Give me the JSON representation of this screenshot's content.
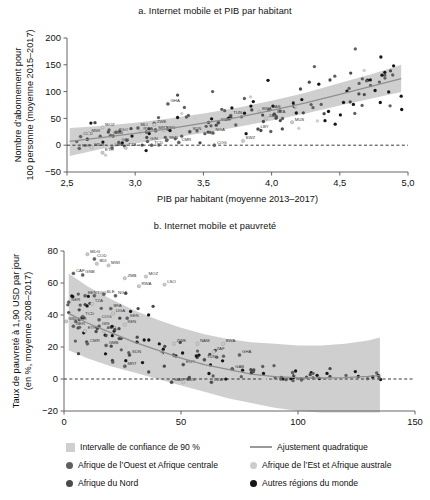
{
  "figure": {
    "panels": [
      {
        "id": "a",
        "title": "a. Internet mobile et PIB par habitant",
        "xlabel": "PIB par habitant (moyenne 2013–2017)",
        "ylabel_line1": "Nombre d’abonnement pour",
        "ylabel_line2": "100 personne (moyenne 2015–2017)"
      },
      {
        "id": "b",
        "title": "b. Internet mobile et pauvreté",
        "xlabel": "Nombre d’abonnement pour 100 personne (moyenne 2015–2017)",
        "ylabel_line1": "Taux de pauvreté à 1,90 USD par jour",
        "ylabel_line2": "(en %, moyenne 2008–2017)"
      }
    ]
  },
  "legend": {
    "items": [
      {
        "marker": "band-swatch",
        "label": "Intervalle de confiance de 90 %"
      },
      {
        "marker": "fit-line",
        "label": "Ajustement quadratique"
      },
      {
        "marker": "dot-ouest",
        "label": "Afrique de l’Ouest et Afrique centrale"
      },
      {
        "marker": "dot-est",
        "label": "Afrique de l’Est et Afrique australe"
      },
      {
        "marker": "dot-nord",
        "label": "Afrique du Nord"
      },
      {
        "marker": "dot-autres",
        "label": "Autres régions du monde"
      }
    ]
  },
  "colors": {
    "band": "#cfcfcf",
    "fit_line": "#8f8f8f",
    "zero_line": "#222222",
    "axis": "#555555",
    "dot_ouest": "#5f5f5f",
    "dot_est": "#cccccc",
    "dot_nord": "#4a4a4a",
    "dot_autres": "#161616"
  },
  "chart_data": [
    {
      "type": "scatter",
      "id": "a",
      "title": "a. Internet mobile et PIB par habitant",
      "xlabel": "PIB par habitant (moyenne 2013–2017)",
      "ylabel": "Nombre d’abonnement pour 100 personne (moyenne 2015–2017)",
      "xlim": [
        2.5,
        5.0
      ],
      "ylim": [
        -50,
        200
      ],
      "xticks": [
        "2,5",
        "3,0",
        "3,5",
        "4,0",
        "4,5",
        "5,0"
      ],
      "xtick_values": [
        2.5,
        3.0,
        3.5,
        4.0,
        4.5,
        5.0
      ],
      "yticks": [
        "200",
        "150",
        "100",
        "50",
        "0",
        "−50"
      ],
      "ytick_values": [
        200,
        150,
        100,
        50,
        0,
        -50
      ],
      "grid": false,
      "legend_position": "below-figure",
      "zero_line": 0,
      "fit_type": "linear/quadratic trend with 90% confidence band",
      "fit_points": [
        [
          2.52,
          7
        ],
        [
          2.75,
          14
        ],
        [
          3.0,
          22
        ],
        [
          3.25,
          31
        ],
        [
          3.5,
          41
        ],
        [
          3.75,
          52
        ],
        [
          4.0,
          65
        ],
        [
          4.25,
          79
        ],
        [
          4.5,
          95
        ],
        [
          4.75,
          111
        ],
        [
          4.95,
          124
        ]
      ],
      "band_upper": [
        [
          2.52,
          32
        ],
        [
          2.75,
          36
        ],
        [
          3.0,
          42
        ],
        [
          3.25,
          50
        ],
        [
          3.5,
          59
        ],
        [
          3.75,
          70
        ],
        [
          4.0,
          83
        ],
        [
          4.25,
          98
        ],
        [
          4.5,
          116
        ],
        [
          4.75,
          134
        ],
        [
          4.95,
          150
        ]
      ],
      "band_lower": [
        [
          2.52,
          -20
        ],
        [
          2.75,
          -7
        ],
        [
          3.0,
          3
        ],
        [
          3.25,
          13
        ],
        [
          3.5,
          23
        ],
        [
          3.75,
          34
        ],
        [
          4.0,
          46
        ],
        [
          4.25,
          59
        ],
        [
          4.5,
          74
        ],
        [
          4.75,
          88
        ],
        [
          4.95,
          99
        ]
      ],
      "labeled_points": [
        {
          "code": "COD",
          "x": 2.6,
          "y": 16,
          "group": "ouest"
        },
        {
          "code": "NER",
          "x": 2.59,
          "y": -6,
          "group": "ouest"
        },
        {
          "code": "MWI",
          "x": 2.66,
          "y": 22,
          "group": "est"
        },
        {
          "code": "MDG",
          "x": 2.68,
          "y": -4,
          "group": "est"
        },
        {
          "code": "MOZ",
          "x": 2.76,
          "y": 33,
          "group": "est"
        },
        {
          "code": "ETH",
          "x": 2.76,
          "y": -14,
          "group": "est"
        },
        {
          "code": "GMB",
          "x": 2.82,
          "y": 18,
          "group": "ouest"
        },
        {
          "code": "TGO",
          "x": 2.86,
          "y": 24,
          "group": "ouest"
        },
        {
          "code": "LBR",
          "x": 2.83,
          "y": -5,
          "group": "ouest"
        },
        {
          "code": "GIN",
          "x": 2.88,
          "y": 5,
          "group": "ouest"
        },
        {
          "code": "TZA",
          "x": 2.93,
          "y": -5,
          "group": "est"
        },
        {
          "code": "MLI",
          "x": 3.02,
          "y": 32,
          "group": "ouest"
        },
        {
          "code": "RWA",
          "x": 3.04,
          "y": 25,
          "group": "est"
        },
        {
          "code": "GIN",
          "x": 3.09,
          "y": 7,
          "group": "ouest"
        },
        {
          "code": "ZWE",
          "x": 3.14,
          "y": 38,
          "group": "est"
        },
        {
          "code": "MRT",
          "x": 3.15,
          "y": 27,
          "group": "ouest"
        },
        {
          "code": "TCD",
          "x": 3.12,
          "y": 0,
          "group": "ouest"
        },
        {
          "code": "KEN",
          "x": 3.21,
          "y": 28,
          "group": "est"
        },
        {
          "code": "GHA",
          "x": 3.24,
          "y": 77,
          "group": "ouest"
        },
        {
          "code": "BEN",
          "x": 3.23,
          "y": 9,
          "group": "ouest"
        },
        {
          "code": "CMR",
          "x": 3.32,
          "y": 5,
          "group": "ouest"
        },
        {
          "code": "SDN",
          "x": 3.4,
          "y": 25,
          "group": "nord"
        },
        {
          "code": "NGA",
          "x": 3.57,
          "y": 23,
          "group": "ouest"
        },
        {
          "code": "COG",
          "x": 3.58,
          "y": 0,
          "group": "ouest"
        },
        {
          "code": "MAR",
          "x": 3.61,
          "y": 42,
          "group": "nord"
        },
        {
          "code": "TUN",
          "x": 3.7,
          "y": 55,
          "group": "nord"
        },
        {
          "code": "SWZ",
          "x": 3.79,
          "y": 8,
          "group": "est"
        },
        {
          "code": "BWA",
          "x": 3.91,
          "y": 62,
          "group": "est"
        },
        {
          "code": "GAB",
          "x": 3.98,
          "y": 66,
          "group": "ouest"
        },
        {
          "code": "DZA",
          "x": 4.02,
          "y": 58,
          "group": "nord"
        },
        {
          "code": "ZAF",
          "x": 3.96,
          "y": 50,
          "group": "est"
        },
        {
          "code": "LBY",
          "x": 3.9,
          "y": 30,
          "group": "nord"
        },
        {
          "code": "MUS",
          "x": 4.15,
          "y": 43,
          "group": "est"
        }
      ],
      "n_points": 140
    },
    {
      "type": "scatter",
      "id": "b",
      "title": "b. Internet mobile et pauvreté",
      "xlabel": "Nombre d’abonnement pour 100 personne (moyenne 2015–2017)",
      "ylabel": "Taux de pauvreté à 1,90 USD par jour (en %, moyenne 2008–2017)",
      "xlim": [
        0,
        150
      ],
      "ylim": [
        -20,
        80
      ],
      "xticks": [
        "0",
        "50",
        "100",
        "150"
      ],
      "xtick_values": [
        0,
        50,
        100,
        150
      ],
      "yticks": [
        "80",
        "60",
        "40",
        "20",
        "0",
        "−20"
      ],
      "ytick_values": [
        80,
        60,
        40,
        20,
        0,
        -20
      ],
      "grid": false,
      "legend_position": "below-figure",
      "zero_line": 0,
      "fit_type": "quadratic fit with 90% confidence band",
      "fit_points": [
        [
          2,
          41
        ],
        [
          10,
          35
        ],
        [
          20,
          29
        ],
        [
          30,
          23
        ],
        [
          40,
          18
        ],
        [
          50,
          13
        ],
        [
          60,
          9
        ],
        [
          70,
          6
        ],
        [
          80,
          3
        ],
        [
          90,
          1.5
        ],
        [
          100,
          0.8
        ],
        [
          110,
          0.6
        ],
        [
          120,
          0.9
        ],
        [
          130,
          1.6
        ],
        [
          135,
          2.2
        ]
      ],
      "band_upper": [
        [
          2,
          66
        ],
        [
          10,
          58
        ],
        [
          20,
          50
        ],
        [
          30,
          43
        ],
        [
          40,
          37
        ],
        [
          50,
          32
        ],
        [
          60,
          28
        ],
        [
          70,
          25
        ],
        [
          80,
          23
        ],
        [
          90,
          22
        ],
        [
          100,
          21
        ],
        [
          110,
          21
        ],
        [
          120,
          22
        ],
        [
          130,
          24
        ],
        [
          135,
          26
        ]
      ],
      "band_lower": [
        [
          2,
          18
        ],
        [
          10,
          13
        ],
        [
          20,
          8
        ],
        [
          30,
          4
        ],
        [
          40,
          0
        ],
        [
          50,
          -4
        ],
        [
          60,
          -8
        ],
        [
          70,
          -12
        ],
        [
          80,
          -15
        ],
        [
          90,
          -18
        ],
        [
          100,
          -20
        ],
        [
          110,
          -21
        ],
        [
          120,
          -21
        ],
        [
          130,
          -21
        ],
        [
          135,
          -21
        ]
      ],
      "labeled_points": [
        {
          "code": "MDG",
          "x": 10,
          "y": 78,
          "group": "est"
        },
        {
          "code": "COD",
          "x": 13,
          "y": 75,
          "group": "ouest"
        },
        {
          "code": "BDI",
          "x": 14,
          "y": 72,
          "group": "est"
        },
        {
          "code": "MWI",
          "x": 19,
          "y": 71,
          "group": "est"
        },
        {
          "code": "CAF",
          "x": 4,
          "y": 66,
          "group": "ouest"
        },
        {
          "code": "GNB",
          "x": 8,
          "y": 65,
          "group": "ouest"
        },
        {
          "code": "ZMB",
          "x": 26,
          "y": 63,
          "group": "est"
        },
        {
          "code": "MOZ",
          "x": 35,
          "y": 64,
          "group": "est"
        },
        {
          "code": "RWA",
          "x": 32,
          "y": 58,
          "group": "est"
        },
        {
          "code": "LSO",
          "x": 43,
          "y": 59,
          "group": "est"
        },
        {
          "code": "NER",
          "x": 2,
          "y": 48,
          "group": "ouest"
        },
        {
          "code": "BEN",
          "x": 9,
          "y": 52,
          "group": "ouest"
        },
        {
          "code": "TGO",
          "x": 13,
          "y": 52,
          "group": "ouest"
        },
        {
          "code": "SLE",
          "x": 17,
          "y": 53,
          "group": "ouest"
        },
        {
          "code": "NGA",
          "x": 22,
          "y": 52,
          "group": "ouest"
        },
        {
          "code": "TZA",
          "x": 12,
          "y": 47,
          "group": "est"
        },
        {
          "code": "BFA",
          "x": 20,
          "y": 44,
          "group": "ouest"
        },
        {
          "code": "UGA",
          "x": 21,
          "y": 41,
          "group": "est"
        },
        {
          "code": "TCD",
          "x": 8,
          "y": 39,
          "group": "ouest"
        },
        {
          "code": "SSD",
          "x": 1,
          "y": 36,
          "group": "est"
        },
        {
          "code": "LBR",
          "x": 5,
          "y": 36,
          "group": "ouest"
        },
        {
          "code": "NER",
          "x": 4,
          "y": 33,
          "group": "ouest"
        },
        {
          "code": "COG",
          "x": 15,
          "y": 37,
          "group": "ouest"
        },
        {
          "code": "SEN",
          "x": 27,
          "y": 38,
          "group": "ouest"
        },
        {
          "code": "GIN",
          "x": 15,
          "y": 33,
          "group": "ouest"
        },
        {
          "code": "AGO",
          "x": 17,
          "y": 30,
          "group": "est"
        },
        {
          "code": "KEN",
          "x": 26,
          "y": 34,
          "group": "est"
        },
        {
          "code": "ETH",
          "x": 9,
          "y": 30,
          "group": "est"
        },
        {
          "code": "CMR",
          "x": 10,
          "y": 22,
          "group": "ouest"
        },
        {
          "code": "GMB",
          "x": 18,
          "y": 21,
          "group": "ouest"
        },
        {
          "code": "SDN",
          "x": 28,
          "y": 15,
          "group": "nord"
        },
        {
          "code": "MRT",
          "x": 26,
          "y": 8,
          "group": "ouest"
        },
        {
          "code": "ZWE",
          "x": 47,
          "y": 22,
          "group": "est"
        },
        {
          "code": "NAM",
          "x": 57,
          "y": 22,
          "group": "est"
        },
        {
          "code": "BWA",
          "x": 68,
          "y": 22,
          "group": "est"
        },
        {
          "code": "ZAF",
          "x": 64,
          "y": 17,
          "group": "est"
        },
        {
          "code": "GHA",
          "x": 75,
          "y": 15,
          "group": "ouest"
        },
        {
          "code": "TUN",
          "x": 60,
          "y": 12,
          "group": "nord"
        },
        {
          "code": "EGY",
          "x": 51,
          "y": 9,
          "group": "nord"
        },
        {
          "code": "GAB",
          "x": 72,
          "y": 6,
          "group": "ouest"
        },
        {
          "code": "MAR",
          "x": 46,
          "y": -2,
          "group": "nord"
        },
        {
          "code": "MUS",
          "x": 51,
          "y": -2,
          "group": "est"
        },
        {
          "code": "DZA",
          "x": 63,
          "y": -2,
          "group": "nord"
        }
      ],
      "n_points": 140
    }
  ]
}
